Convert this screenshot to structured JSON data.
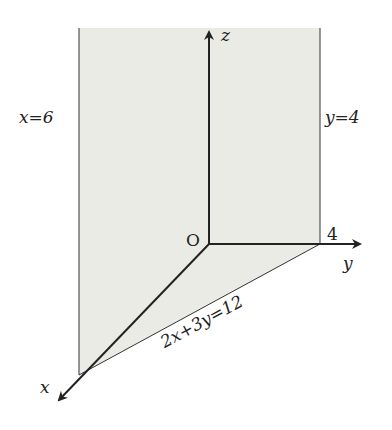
{
  "figure": {
    "colors": {
      "shade": "#ebebe6",
      "line": "#222222",
      "background": "#ffffff"
    },
    "labels": {
      "plane_x": "x=6",
      "plane_y": "y=4",
      "plane_diag": "2x+3y=12",
      "axis_x": "x",
      "axis_y": "y",
      "axis_z": "z",
      "origin": "O",
      "y_intercept": "4"
    },
    "geometry": {
      "origin": [
        209,
        244
      ],
      "z_axis_end": [
        209,
        30
      ],
      "y_axis_end": [
        362,
        244
      ],
      "x_axis_end": [
        57,
        402
      ],
      "plane_x_line": [
        [
          79,
          28
        ],
        [
          79,
          375
        ]
      ],
      "plane_y_line": [
        [
          320,
          28
        ],
        [
          320,
          244
        ]
      ],
      "diag_line": [
        [
          320,
          244
        ],
        [
          79,
          375
        ]
      ]
    }
  }
}
